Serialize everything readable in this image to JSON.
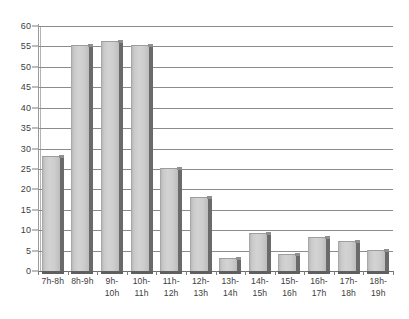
{
  "chart_data": {
    "type": "bar",
    "title": "",
    "subtitle": "",
    "xlabel": "",
    "ylabel": "",
    "categories": [
      "7h-8h",
      "8h-9h",
      "9h-\n10h",
      "10h-\n11h",
      "11h-\n12h",
      "12h-\n13h",
      "13h-\n14h",
      "14h-\n15h",
      "15h-\n16h",
      "16h-\n17h",
      "17h-\n18h",
      "18h-\n19h"
    ],
    "values": [
      28,
      55,
      56,
      55,
      25,
      18,
      3,
      9,
      4,
      8,
      7,
      5
    ],
    "ylim": [
      0,
      60
    ],
    "ytick_step": 5,
    "yticks": [
      0,
      5,
      10,
      15,
      20,
      25,
      30,
      35,
      40,
      45,
      50,
      55,
      60
    ],
    "ytick_labels": [
      "0",
      "5",
      "10",
      "15",
      "20",
      "25",
      "30",
      "35",
      "40",
      "45",
      "50",
      "55",
      "60"
    ],
    "grid": true,
    "grid_axis": "y",
    "legend": false,
    "legend_position": "none",
    "series": [
      {
        "name": "",
        "values": [
          28,
          55,
          56,
          55,
          25,
          18,
          3,
          9,
          4,
          8,
          7,
          5
        ]
      }
    ],
    "annotations": []
  },
  "style": {
    "background": "#ffffff",
    "bar_face": "#d0d0d0",
    "bar_shadow": "#6a6a6a",
    "grid_color": "#8c8c8c",
    "axis_color": "#6e6e6e",
    "text_color": "#3d3d3d"
  }
}
